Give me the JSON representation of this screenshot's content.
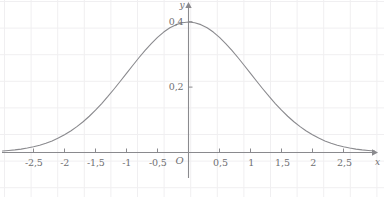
{
  "chart_data": {
    "type": "line",
    "title": "",
    "subtitle": "",
    "xlabel": "x",
    "ylabel": "y",
    "origin_label": "O",
    "grid": true,
    "legend": null,
    "xlim": [
      -3.0,
      3.05
    ],
    "ylim": [
      -0.06,
      0.46
    ],
    "x_tick_labels": [
      "-2,5",
      "-2",
      "-1,5",
      "-1",
      "-0,5",
      "0,5",
      "1",
      "1,5",
      "2",
      "2,5"
    ],
    "x_tick_values": [
      -2.5,
      -2,
      -1.5,
      -1,
      -0.5,
      0.5,
      1,
      1.5,
      2,
      2.5
    ],
    "y_tick_labels": [
      "0,2",
      "0,4"
    ],
    "y_tick_values": [
      0.2,
      0.4
    ],
    "series": [
      {
        "name": "standard normal density",
        "x": [
          -3.0,
          -2.9,
          -2.8,
          -2.7,
          -2.6,
          -2.5,
          -2.4,
          -2.3,
          -2.2,
          -2.1,
          -2.0,
          -1.9,
          -1.8,
          -1.7,
          -1.6,
          -1.5,
          -1.4,
          -1.3,
          -1.2,
          -1.1,
          -1.0,
          -0.9,
          -0.8,
          -0.7,
          -0.6,
          -0.5,
          -0.4,
          -0.3,
          -0.2,
          -0.1,
          0.0,
          0.1,
          0.2,
          0.3,
          0.4,
          0.5,
          0.6,
          0.7,
          0.8,
          0.9,
          1.0,
          1.1,
          1.2,
          1.3,
          1.4,
          1.5,
          1.6,
          1.7,
          1.8,
          1.9,
          2.0,
          2.1,
          2.2,
          2.3,
          2.4,
          2.5,
          2.6,
          2.7,
          2.8,
          2.9,
          3.0
        ],
        "y": [
          0.0044,
          0.006,
          0.0079,
          0.0104,
          0.0136,
          0.0175,
          0.0224,
          0.0283,
          0.0355,
          0.044,
          0.054,
          0.0656,
          0.079,
          0.094,
          0.1109,
          0.1295,
          0.1497,
          0.1714,
          0.1942,
          0.2179,
          0.242,
          0.2661,
          0.2897,
          0.3123,
          0.3332,
          0.3521,
          0.3683,
          0.3814,
          0.391,
          0.397,
          0.3989,
          0.397,
          0.391,
          0.3814,
          0.3683,
          0.3521,
          0.3332,
          0.3123,
          0.2897,
          0.2661,
          0.242,
          0.2179,
          0.1942,
          0.1714,
          0.1497,
          0.1295,
          0.1109,
          0.094,
          0.079,
          0.0656,
          0.054,
          0.044,
          0.0355,
          0.0283,
          0.0224,
          0.0175,
          0.0136,
          0.0104,
          0.0079,
          0.006,
          0.0044
        ]
      }
    ],
    "colors": {
      "curve": "#8a8a8e",
      "axis": "#8a8a8e",
      "grid": "#f0eff1",
      "text": "#6f6f72",
      "background": "#ffffff"
    }
  }
}
